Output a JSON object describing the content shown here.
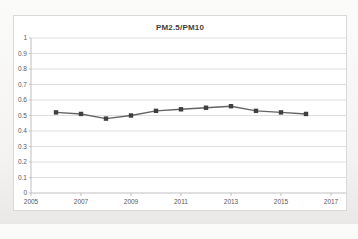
{
  "chart": {
    "title": "PM2.5/PM10",
    "colors": {
      "background": "#ffffff",
      "border": "#d9d9d9",
      "gridline": "#dedede",
      "axis": "#bfbfbf",
      "tick_label": "#595959",
      "title": "#3f3f3f",
      "line": "#646464",
      "marker": "#3f3f3f"
    }
  },
  "chart_data": {
    "type": "line",
    "title": "PM2.5/PM10",
    "x": [
      2006,
      2007,
      2008,
      2009,
      2010,
      2011,
      2012,
      2013,
      2014,
      2015,
      2016
    ],
    "values": [
      0.52,
      0.51,
      0.48,
      0.5,
      0.53,
      0.54,
      0.55,
      0.56,
      0.53,
      0.52,
      0.51
    ],
    "series": [
      {
        "name": "PM2.5/PM10 ratio",
        "values": [
          0.52,
          0.51,
          0.48,
          0.5,
          0.53,
          0.54,
          0.55,
          0.56,
          0.53,
          0.52,
          0.51
        ]
      }
    ],
    "xlabel": "",
    "ylabel": "",
    "xlim": [
      2005,
      2017
    ],
    "ylim": [
      0,
      1
    ],
    "x_ticks": [
      {
        "value": 2005,
        "label": "2005"
      },
      {
        "value": 2007,
        "label": "2007"
      },
      {
        "value": 2009,
        "label": "2009"
      },
      {
        "value": 2011,
        "label": "2011"
      },
      {
        "value": 2013,
        "label": "2013"
      },
      {
        "value": 2015,
        "label": "2015"
      },
      {
        "value": 2017,
        "label": "2017"
      }
    ],
    "y_ticks": [
      {
        "value": 1.0,
        "label": "1"
      },
      {
        "value": 0.9,
        "label": "0.9"
      },
      {
        "value": 0.8,
        "label": "0.8"
      },
      {
        "value": 0.7,
        "label": "0.7"
      },
      {
        "value": 0.6,
        "label": "0.6"
      },
      {
        "value": 0.5,
        "label": "0.5"
      },
      {
        "value": 0.4,
        "label": "0.4"
      },
      {
        "value": 0.3,
        "label": "0.3"
      },
      {
        "value": 0.2,
        "label": "0.2"
      },
      {
        "value": 0.1,
        "label": "0.1"
      },
      {
        "value": 0.0,
        "label": "0"
      }
    ],
    "grid": true,
    "legend": false,
    "marker": "square"
  }
}
